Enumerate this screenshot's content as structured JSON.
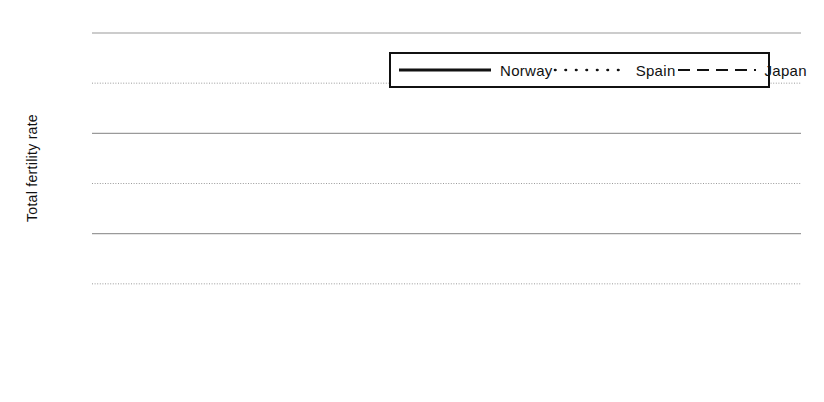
{
  "chart_data": {
    "type": "line",
    "title": "",
    "xlabel": "",
    "ylabel": "Total fertility rate",
    "xlim": [
      1970,
      1999
    ],
    "ylim": [
      0.0,
      3.0
    ],
    "ytick_step": 0.5,
    "xtick_step": 1,
    "xtick_label_step": 5,
    "grid": true,
    "legend_position": "top-right-inside",
    "x": [
      1970,
      1971,
      1972,
      1973,
      1974,
      1975,
      1976,
      1977,
      1978,
      1979,
      1980,
      1981,
      1982,
      1983,
      1984,
      1985,
      1986,
      1987,
      1988,
      1989,
      1990,
      1991,
      1992,
      1993,
      1994,
      1995,
      1996,
      1997,
      1998,
      1999
    ],
    "series": [
      {
        "name": "Norway",
        "style": "solid",
        "color": "#111111",
        "values": [
          2.5,
          2.51,
          2.39,
          2.23,
          2.13,
          1.98,
          1.86,
          1.75,
          1.77,
          1.75,
          1.72,
          1.7,
          1.71,
          1.66,
          1.66,
          1.68,
          1.71,
          1.75,
          1.84,
          1.89,
          1.93,
          1.92,
          1.88,
          1.86,
          1.87,
          1.87,
          1.89,
          1.86,
          1.81,
          1.85
        ]
      },
      {
        "name": "Spain",
        "style": "dotted",
        "color": "#111111",
        "values": [
          2.84,
          2.85,
          2.85,
          2.84,
          2.84,
          2.79,
          2.64,
          2.51,
          2.39,
          2.27,
          2.2,
          2.04,
          1.94,
          1.8,
          1.73,
          1.64,
          1.56,
          1.5,
          1.45,
          1.4,
          1.36,
          1.33,
          1.32,
          1.26,
          1.21,
          1.18,
          1.17,
          1.17,
          1.16,
          1.2
        ]
      },
      {
        "name": "Japan",
        "style": "dashed",
        "color": "#111111",
        "values": [
          2.13,
          2.16,
          2.17,
          2.14,
          2.05,
          1.91,
          1.85,
          1.8,
          1.79,
          1.77,
          1.75,
          1.74,
          1.77,
          1.8,
          1.81,
          1.76,
          1.72,
          1.69,
          1.66,
          1.57,
          1.54,
          1.53,
          1.5,
          1.46,
          1.5,
          1.42,
          1.43,
          1.39,
          1.38,
          1.38
        ]
      }
    ],
    "ytick_labels": [
      "0.00",
      "0.50",
      "1.00",
      "1.50",
      "2.00",
      "2.50",
      "3.00"
    ],
    "ytick_values": [
      0.0,
      0.5,
      1.0,
      1.5,
      2.0,
      2.5,
      3.0
    ],
    "xtick_labels": [
      "1970",
      "1975",
      "1980",
      "1985",
      "1990",
      "1995"
    ],
    "xtick_label_values": [
      1970,
      1975,
      1980,
      1985,
      1990,
      1995
    ]
  },
  "legend": {
    "items": [
      {
        "label": "Norway",
        "style": "solid"
      },
      {
        "label": "Spain",
        "style": "dotted"
      },
      {
        "label": "Japan",
        "style": "dashed"
      }
    ]
  }
}
